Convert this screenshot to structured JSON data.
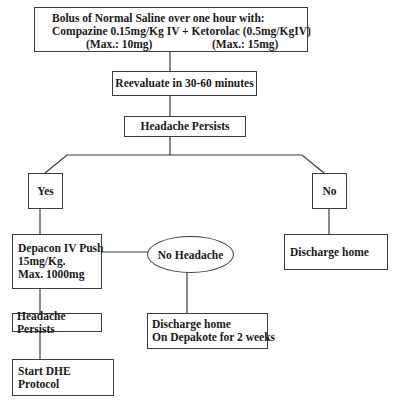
{
  "diagram": {
    "type": "flowchart",
    "nodes": {
      "start": {
        "line1": "Bolus of Normal Saline over one hour with:",
        "line2": "Compazine 0.15mg/Kg IV + Ketorolac (0.5mg/KgIV)",
        "max_compazine": "(Max.: 10mg)",
        "max_ketorolac": "(Max.: 15mg)"
      },
      "reevaluate": "Reevaluate in 30-60 minutes",
      "headache_persists_1": "Headache Persists",
      "yes": "Yes",
      "no": "No",
      "depacon": {
        "line1": "Depacon IV Push",
        "line2": "15mg/Kg.",
        "line3": "Max. 1000mg"
      },
      "no_headache": "No Headache",
      "discharge_home": "Discharge home",
      "headache_persists_2": "Headache Persists",
      "discharge_depakote": {
        "line1": "Discharge home",
        "line2": "On Depakote for 2 weeks"
      },
      "start_dhe": "Start DHE Protocol"
    },
    "edges": [
      [
        "start",
        "reevaluate"
      ],
      [
        "reevaluate",
        "headache_persists_1"
      ],
      [
        "headache_persists_1",
        "yes"
      ],
      [
        "headache_persists_1",
        "no"
      ],
      [
        "yes",
        "depacon"
      ],
      [
        "no",
        "discharge_home"
      ],
      [
        "depacon",
        "no_headache"
      ],
      [
        "no_headache",
        "discharge_depakote"
      ],
      [
        "depacon",
        "headache_persists_2"
      ],
      [
        "headache_persists_2",
        "start_dhe"
      ]
    ],
    "colors": {
      "line": "#3a3a3a",
      "text": "#1a1a1a",
      "background": "#ffffff"
    }
  }
}
